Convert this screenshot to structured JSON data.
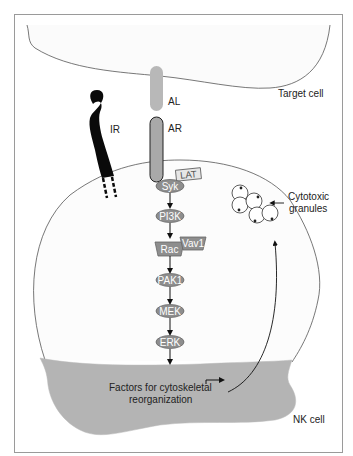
{
  "diagram": {
    "colors": {
      "frame": "#9a9a9a",
      "cytoplasm_shade": "#b4b4b4",
      "node_fill": "#8e8e8e",
      "receptor_fill": "#a9a9a9",
      "ligand_fill": "#b8b8b8",
      "ir_fill": "#0a0a0a"
    },
    "labels": {
      "target_cell": "Target cell",
      "al": "AL",
      "ar": "AR",
      "ir": "IR",
      "cytotoxic": "Cytotoxic",
      "granules": "granules",
      "factors_line1": "Factors for cytoskeletal",
      "factors_line2": "reorganization",
      "nk_cell": "NK cell"
    },
    "nodes": {
      "lat": "LAT",
      "syk": "Syk",
      "pi3k": "PI3K",
      "rac": "Rac",
      "vav1": "Vav1",
      "pak1": "PAK1",
      "mek": "MEK",
      "erk": "ERK"
    },
    "pathway": [
      "Syk",
      "PI3K",
      "Rac",
      "PAK1",
      "MEK",
      "ERK",
      "Factors for cytoskeletal reorganization"
    ]
  }
}
